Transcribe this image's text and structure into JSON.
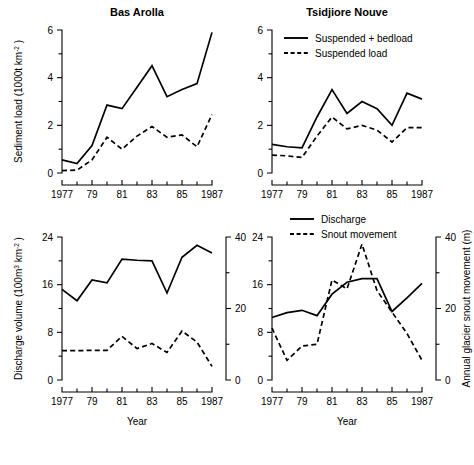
{
  "figure": {
    "width": 474,
    "height": 465,
    "background": "#ffffff",
    "ink": "#000000"
  },
  "chart_data": [
    {
      "id": "bas-arolla-sediment",
      "type": "line",
      "title": "Bas Arolla",
      "panel_position": "top-left",
      "xlabel": "",
      "ylabel": "Sediment load (1000t km-2)",
      "ylabel_parts": {
        "text": "Sediment load (1000t km",
        "sup": "-2",
        "tail": " )"
      },
      "x": [
        1977,
        1978,
        1979,
        1980,
        1981,
        1982,
        1983,
        1984,
        1985,
        1986,
        1987
      ],
      "xtick_labels": [
        "1977",
        "",
        "79",
        "",
        "81",
        "",
        "83",
        "",
        "85",
        "",
        "1987"
      ],
      "xlim": [
        1977,
        1987
      ],
      "ylim": [
        0,
        6
      ],
      "yticks": [
        0,
        2,
        4,
        6
      ],
      "ytick_labels": [
        "0",
        "2",
        "4",
        "6"
      ],
      "yminor": [
        1,
        3,
        5
      ],
      "grid": false,
      "series": [
        {
          "name": "Suspended + bedload",
          "style": "solid",
          "values": [
            0.55,
            0.4,
            1.15,
            2.85,
            2.7,
            3.6,
            4.5,
            3.2,
            3.5,
            3.75,
            5.9
          ]
        },
        {
          "name": "Suspended load",
          "style": "dashed",
          "values": [
            0.1,
            0.12,
            0.55,
            1.5,
            1.0,
            1.55,
            1.95,
            1.5,
            1.6,
            1.1,
            2.45
          ]
        }
      ]
    },
    {
      "id": "tsidjiore-nouve-sediment",
      "type": "line",
      "title": "Tsidjiore Nouve",
      "panel_position": "top-right",
      "xlabel": "",
      "ylabel": "",
      "x": [
        1977,
        1978,
        1979,
        1980,
        1981,
        1982,
        1983,
        1984,
        1985,
        1986,
        1987
      ],
      "xtick_labels": [
        "1977",
        "",
        "79",
        "",
        "81",
        "",
        "83",
        "",
        "85",
        "",
        "1987"
      ],
      "xlim": [
        1977,
        1987
      ],
      "ylim": [
        0,
        6
      ],
      "yticks": [
        0,
        2,
        4,
        6
      ],
      "ytick_labels": [
        "0",
        "2",
        "4",
        "6"
      ],
      "yminor": [
        1,
        3,
        5
      ],
      "grid": false,
      "legend_position": "top-left",
      "series": [
        {
          "name": "Suspended + bedload",
          "style": "solid",
          "values": [
            1.2,
            1.1,
            1.05,
            2.35,
            3.5,
            2.5,
            3.0,
            2.7,
            2.0,
            3.35,
            3.1
          ]
        },
        {
          "name": "Suspended load",
          "style": "dashed",
          "values": [
            0.75,
            0.72,
            0.65,
            1.55,
            2.35,
            1.85,
            2.0,
            1.8,
            1.3,
            1.9,
            1.9
          ]
        }
      ]
    },
    {
      "id": "bas-arolla-discharge",
      "type": "line",
      "title": "",
      "panel_position": "bottom-left",
      "xlabel": "Year",
      "ylabel": "Discharge volume (100m3 km-2)",
      "ylabel_parts": {
        "text": "Discharge volume (100m",
        "sup3": "3",
        "mid": " km",
        "sup": "-2",
        "tail": " )"
      },
      "x": [
        1977,
        1978,
        1979,
        1980,
        1981,
        1982,
        1983,
        1984,
        1985,
        1986,
        1987
      ],
      "xtick_labels": [
        "1977",
        "",
        "79",
        "",
        "81",
        "",
        "83",
        "",
        "85",
        "",
        "1987"
      ],
      "xlim": [
        1977,
        1987
      ],
      "ylim": [
        0,
        24
      ],
      "yticks": [
        0,
        8,
        16,
        24
      ],
      "ytick_labels": [
        "0",
        "8",
        "16",
        "24"
      ],
      "yminor": [
        4,
        12,
        20
      ],
      "y2lim": [
        0,
        40
      ],
      "y2ticks": [
        0,
        20,
        40
      ],
      "y2tick_labels": [
        "0",
        "20",
        "40"
      ],
      "y2minor": [
        10,
        30
      ],
      "y2label": "",
      "grid": false,
      "series": [
        {
          "name": "Discharge",
          "style": "solid",
          "axis": "left",
          "values": [
            15.2,
            13.3,
            16.8,
            16.3,
            20.3,
            20.1,
            20.0,
            14.6,
            20.6,
            22.6,
            21.3
          ]
        },
        {
          "name": "Snout movement",
          "style": "dashed",
          "axis": "right",
          "values": [
            8.2,
            8.2,
            8.3,
            8.3,
            12.2,
            8.8,
            10.2,
            7.7,
            13.7,
            10.6,
            3.8
          ]
        }
      ]
    },
    {
      "id": "tsidjiore-nouve-discharge",
      "type": "line",
      "title": "",
      "panel_position": "bottom-right",
      "xlabel": "Year",
      "ylabel": "",
      "x": [
        1977,
        1978,
        1979,
        1980,
        1981,
        1982,
        1983,
        1984,
        1985,
        1986,
        1987
      ],
      "xtick_labels": [
        "1977",
        "",
        "79",
        "",
        "81",
        "",
        "83",
        "",
        "85",
        "",
        "1987"
      ],
      "xlim": [
        1977,
        1987
      ],
      "ylim": [
        0,
        24
      ],
      "yticks": [
        0,
        8,
        16,
        24
      ],
      "ytick_labels": [
        "0",
        "8",
        "16",
        "24"
      ],
      "yminor": [
        4,
        12,
        20
      ],
      "y2lim": [
        0,
        40
      ],
      "y2ticks": [
        0,
        20,
        40
      ],
      "y2tick_labels": [
        "0",
        "20",
        "40"
      ],
      "y2minor": [
        10,
        30
      ],
      "y2label": "Annual glacier snout movement (m)",
      "grid": false,
      "legend_position": "top-center",
      "series": [
        {
          "name": "Discharge",
          "style": "solid",
          "axis": "left",
          "values": [
            10.5,
            11.3,
            11.7,
            10.8,
            14.4,
            16.4,
            17.0,
            17.0,
            11.5,
            13.8,
            16.2,
            16.2
          ]
        },
        {
          "name": "Snout movement",
          "style": "dashed",
          "axis": "right",
          "values": [
            14.5,
            5.5,
            9.5,
            10.0,
            28.0,
            25.5,
            38.0,
            25.0,
            19.0,
            13.0,
            5.5
          ]
        }
      ]
    }
  ],
  "legends": {
    "sediment": [
      {
        "label": "Suspended + bedload",
        "style": "solid"
      },
      {
        "label": "Suspended load",
        "style": "dashed"
      }
    ],
    "discharge": [
      {
        "label": "Discharge",
        "style": "solid"
      },
      {
        "label": "Snout movement",
        "style": "dashed"
      }
    ]
  },
  "axis_titles": {
    "year": "Year"
  }
}
